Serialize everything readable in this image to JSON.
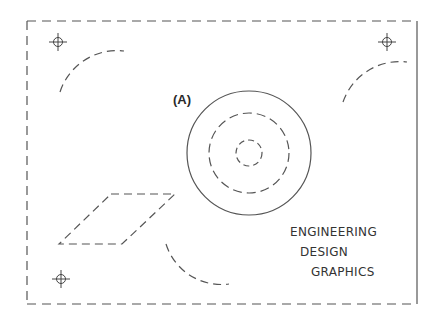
{
  "drawing": {
    "label": "(A)",
    "title_lines": [
      "ENGINEERING",
      "DESIGN",
      "GRAPHICS"
    ],
    "line_color": "#555555",
    "frame": {
      "left": 27,
      "top": 21,
      "right": 417,
      "bottom": 304,
      "right_edge": "solid",
      "other_edges": "dashed"
    },
    "registration_marks": [
      {
        "name": "top-left",
        "x": 58,
        "y": 42
      },
      {
        "name": "top-right",
        "x": 387,
        "y": 42
      },
      {
        "name": "bottom-left",
        "x": 61,
        "y": 279
      }
    ],
    "concentric_circles": {
      "cx": 249,
      "cy": 153,
      "outer_solid_r": 62,
      "middle_dashed_r": 40,
      "inner_dashed_r": 13
    },
    "dashed_arcs": [
      "top-left arc",
      "top-right arc",
      "bottom-center arc"
    ],
    "dashed_parallelogram": true
  }
}
